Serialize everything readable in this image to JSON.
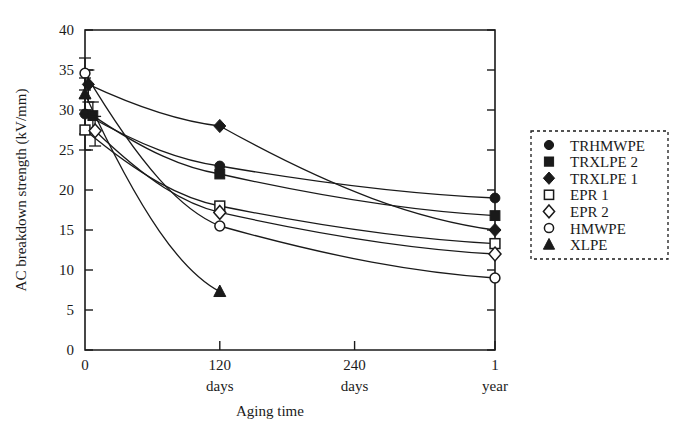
{
  "chart_data": {
    "type": "line",
    "title": "",
    "xlabel": "Aging time",
    "ylabel": "AC breakdown strength (kV/mm)",
    "xlim": [
      0,
      365
    ],
    "ylim": [
      0,
      40
    ],
    "grid": false,
    "legend_position": "right",
    "y_ticks": [
      0,
      5,
      10,
      15,
      20,
      25,
      30,
      35,
      40
    ],
    "y_tick_labels": [
      "0",
      "5",
      "10",
      "15",
      "20",
      "25",
      "30",
      "35",
      "40"
    ],
    "x_ticks": [
      0,
      120,
      240,
      365
    ],
    "x_tick_labels": [
      "0",
      "120",
      "240",
      "1"
    ],
    "x_tick_sublabels": [
      "",
      "days",
      "days",
      "year"
    ],
    "series": [
      {
        "name": "TRHMWPE",
        "marker": "filled-circle",
        "points": [
          {
            "x": 0,
            "y": 29.5
          },
          {
            "x": 120,
            "y": 23.0
          },
          {
            "x": 365,
            "y": 19.0
          }
        ],
        "errorbar": {
          "x": 0,
          "low": 27.0,
          "high": 31.5
        }
      },
      {
        "name": "TRXLPE 2",
        "marker": "filled-square",
        "points": [
          {
            "x": 7,
            "y": 29.3
          },
          {
            "x": 120,
            "y": 22.0
          },
          {
            "x": 365,
            "y": 16.8
          }
        ],
        "errorbar": {
          "x": 7,
          "low": 27.3,
          "high": 31.0
        }
      },
      {
        "name": "TRXLPE 1",
        "marker": "filled-diamond",
        "points": [
          {
            "x": 3,
            "y": 33.2
          },
          {
            "x": 120,
            "y": 28.0
          },
          {
            "x": 365,
            "y": 15.0
          }
        ],
        "errorbar": {
          "x": 3,
          "low": 31.0,
          "high": 35.0
        }
      },
      {
        "name": "EPR 1",
        "marker": "open-square",
        "points": [
          {
            "x": 0,
            "y": 27.5
          },
          {
            "x": 120,
            "y": 18.0
          },
          {
            "x": 365,
            "y": 13.3
          }
        ],
        "errorbar": {
          "x": 0,
          "low": 25.0,
          "high": 29.5
        }
      },
      {
        "name": "EPR 2",
        "marker": "open-diamond",
        "points": [
          {
            "x": 9,
            "y": 27.4
          },
          {
            "x": 120,
            "y": 17.2
          },
          {
            "x": 365,
            "y": 12.0
          }
        ],
        "errorbar": {
          "x": 9,
          "low": 25.5,
          "high": 29.2
        }
      },
      {
        "name": "HMWPE",
        "marker": "open-circle",
        "points": [
          {
            "x": 0,
            "y": 34.6
          },
          {
            "x": 120,
            "y": 15.5
          },
          {
            "x": 365,
            "y": 9.0
          }
        ],
        "errorbar": {
          "x": 0,
          "low": 32.5,
          "high": 36.5
        }
      },
      {
        "name": "XLPE",
        "marker": "filled-triangle",
        "points": [
          {
            "x": 0,
            "y": 32.0
          },
          {
            "x": 120,
            "y": 7.3
          }
        ],
        "errorbar": {
          "x": 0,
          "low": 30.0,
          "high": 34.0
        }
      }
    ]
  },
  "legend": {
    "items": [
      {
        "label": "TRHMWPE",
        "marker": "filled-circle"
      },
      {
        "label": "TRXLPE 2",
        "marker": "filled-square"
      },
      {
        "label": "TRXLPE 1",
        "marker": "filled-diamond"
      },
      {
        "label": "EPR 1",
        "marker": "open-square"
      },
      {
        "label": "EPR 2",
        "marker": "open-diamond"
      },
      {
        "label": "HMWPE",
        "marker": "open-circle"
      },
      {
        "label": "XLPE",
        "marker": "filled-triangle"
      }
    ]
  },
  "colors": {
    "ink": "#1a1a1a",
    "background": "#ffffff"
  }
}
